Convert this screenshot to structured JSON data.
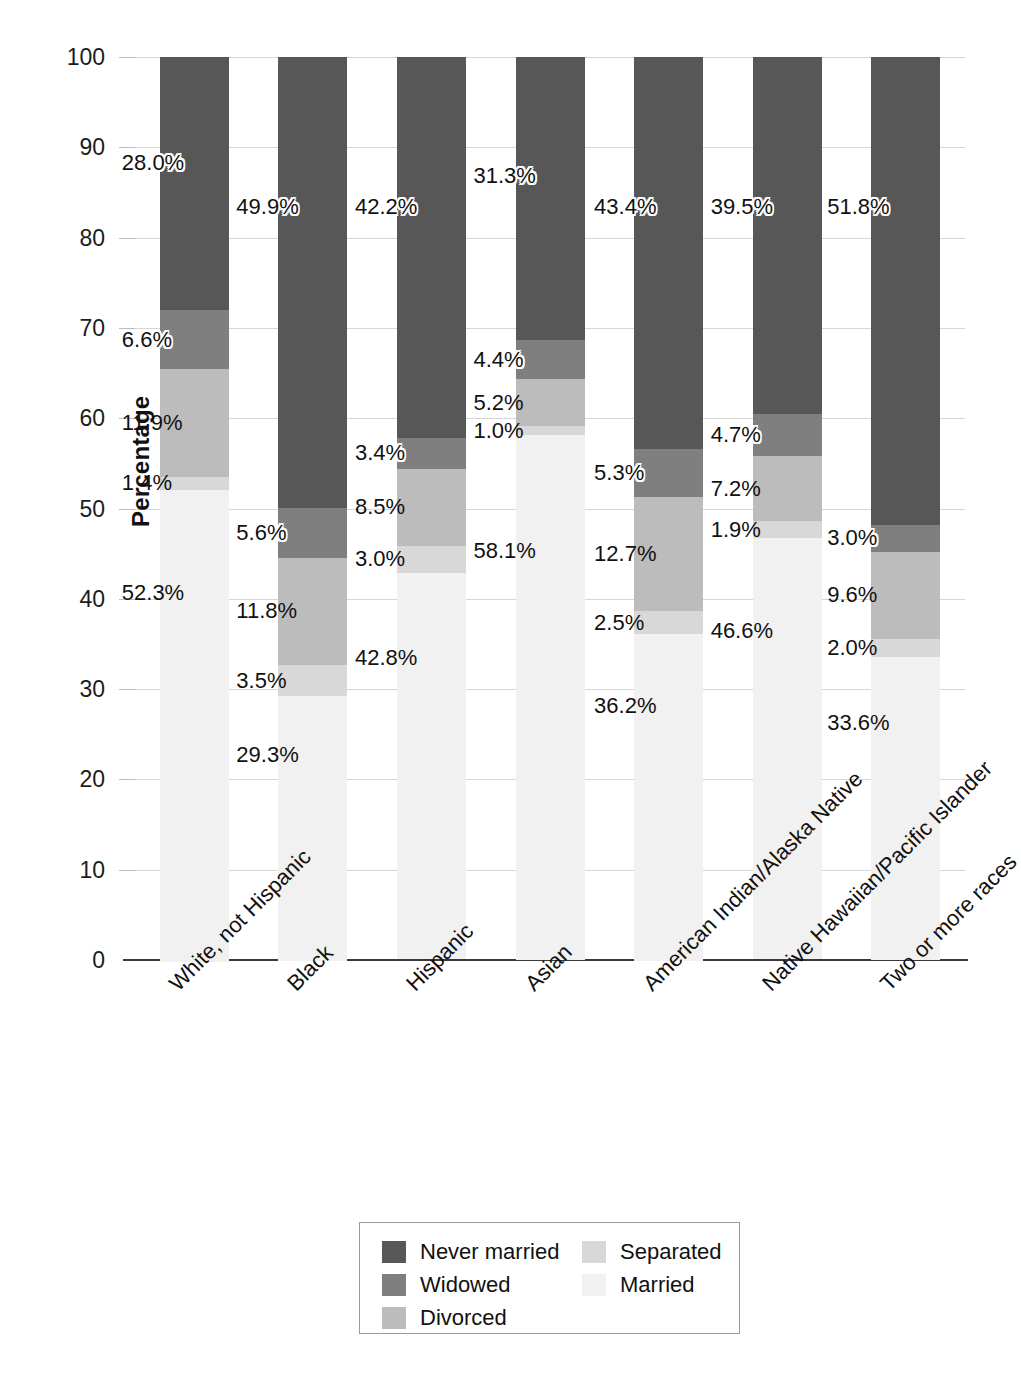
{
  "chart_data": {
    "type": "bar",
    "subtype": "stacked-bar-100",
    "title": "",
    "xlabel": "",
    "ylabel": "Percentage",
    "ylim": [
      0,
      100
    ],
    "ytick_labels": [
      "0",
      "10",
      "20",
      "30",
      "40",
      "50",
      "60",
      "70",
      "80",
      "90",
      "100"
    ],
    "ytick_values": [
      0,
      10,
      20,
      30,
      40,
      50,
      60,
      70,
      80,
      90,
      100
    ],
    "grid": true,
    "legend_position": "bottom",
    "value_label_suffix": "%",
    "categories": [
      "White, not Hispanic",
      "Black",
      "Hispanic",
      "Asian",
      "American Indian/Alaska Native",
      "Native Hawaiian/Pacific Islander",
      "Two or more races"
    ],
    "series": [
      {
        "name": "Never married",
        "color": "#575757",
        "values": [
          28.0,
          49.9,
          42.2,
          31.3,
          43.4,
          39.5,
          51.8
        ],
        "labels": [
          "28.0%",
          "49.9%",
          "42.2%",
          "31.3%",
          "43.4%",
          "39.5%",
          "51.8%"
        ]
      },
      {
        "name": "Widowed",
        "color": "#7f7f7f",
        "values": [
          6.6,
          5.6,
          3.4,
          4.4,
          5.3,
          4.7,
          3.0
        ],
        "labels": [
          "6.6%",
          "5.6%",
          "3.4%",
          "4.4%",
          "5.3%",
          "4.7%",
          "3.0%"
        ]
      },
      {
        "name": "Divorced",
        "color": "#bcbcbc",
        "values": [
          11.9,
          11.8,
          8.5,
          5.2,
          12.7,
          7.2,
          9.6
        ],
        "labels": [
          "11.9%",
          "11.8%",
          "8.5%",
          "5.2%",
          "12.7%",
          "7.2%",
          "9.6%"
        ]
      },
      {
        "name": "Separated",
        "color": "#d8d8d8",
        "values": [
          1.4,
          3.5,
          3.0,
          1.0,
          2.5,
          1.9,
          2.0
        ],
        "labels": [
          "1.4%",
          "3.5%",
          "3.0%",
          "1.0%",
          "2.5%",
          "1.9%",
          "2.0%"
        ]
      },
      {
        "name": "Married",
        "color": "#f1f1f1",
        "values": [
          52.3,
          29.3,
          42.8,
          58.1,
          36.2,
          46.6,
          33.6
        ],
        "labels": [
          "52.3%",
          "29.3%",
          "42.8%",
          "58.1%",
          "36.2%",
          "46.6%",
          "33.6%"
        ]
      }
    ],
    "legend": {
      "column_1": [
        "Never married",
        "Widowed",
        "Divorced"
      ],
      "column_2": [
        "Separated",
        "Married"
      ]
    }
  }
}
